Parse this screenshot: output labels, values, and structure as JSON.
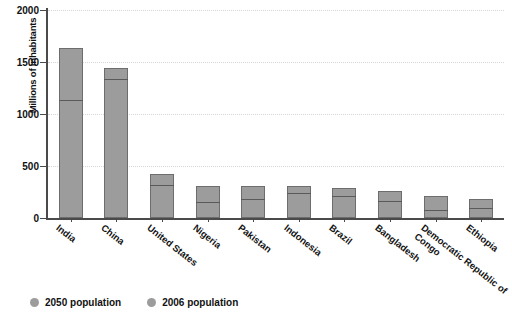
{
  "chart_data": {
    "type": "bar",
    "title": "",
    "subtitle": "",
    "xlabel": "",
    "ylabel": "Millions of inhabitants",
    "ylim": [
      0,
      2000
    ],
    "yticks": [
      0,
      500,
      1000,
      1500,
      2000
    ],
    "grid": true,
    "legend_position": "bottom-left",
    "stacked": true,
    "categories": [
      "India",
      "China",
      "United States",
      "Nigeria",
      "Pakistan",
      "Indonesia",
      "Brazil",
      "Bangladesh",
      "Democratic Republic of Congo",
      "Ethiopia"
    ],
    "series": [
      {
        "name": "2050 population",
        "values": [
          1630,
          1440,
          420,
          310,
          310,
          310,
          285,
          260,
          215,
          185
        ]
      },
      {
        "name": "2006 population",
        "values": [
          1120,
          1320,
          300,
          135,
          165,
          225,
          190,
          145,
          60,
          75
        ]
      }
    ]
  },
  "axis": {
    "y_title": "Millions of inhabitants",
    "y_tick_labels": [
      "2000",
      "1500",
      "1000",
      "500",
      "0"
    ]
  },
  "legend": {
    "items": [
      {
        "label": "2050 population",
        "color": "#9c9c9c",
        "marker": "circle"
      },
      {
        "label": "2006 population",
        "color": "#9c9c9c",
        "marker": "circle"
      }
    ]
  },
  "colors": {
    "bar_fill": "#9c9c9c",
    "bar_stroke": "#6d6d6d",
    "split_line": "#5a5a5a",
    "axis": "#4a4a4a",
    "gridline": "#c9c9c9",
    "text": "#111111",
    "background": "#ffffff"
  }
}
